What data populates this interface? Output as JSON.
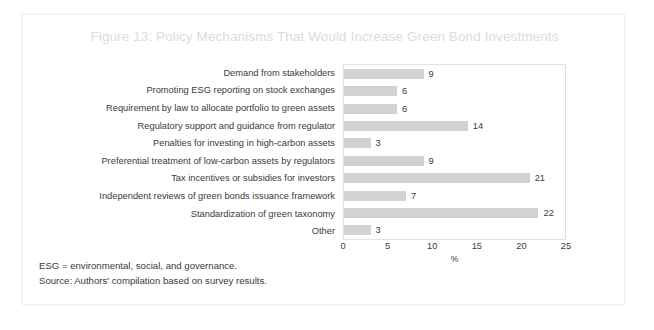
{
  "figure": {
    "title": "Figure 13: Policy Mechanisms That Would Increase Green Bond Investments",
    "notes": [
      "ESG = environmental, social, and governance.",
      "Source: Authors' compilation based on survey results."
    ]
  },
  "chart_data": {
    "type": "bar",
    "orientation": "horizontal",
    "title": "Figure 13: Policy Mechanisms That Would Increase Green Bond Investments",
    "categories": [
      "Demand from stakeholders",
      "Promoting ESG reporting on stock exchanges",
      "Requirement by law to allocate portfolio to green assets",
      "Regulatory support and guidance from regulator",
      "Penalties for investing in high-carbon assets",
      "Preferential treatment of low-carbon assets by regulators",
      "Tax incentives or subsidies for investors",
      "Independent reviews of green bonds issuance framework",
      "Standardization of green taxonomy",
      "Other"
    ],
    "values": [
      9,
      6,
      6,
      14,
      3,
      9,
      21,
      7,
      22,
      3
    ],
    "xlabel": "%",
    "ylabel": "",
    "xlim": [
      0,
      25
    ],
    "xticks": [
      0,
      5,
      10,
      15,
      20,
      25
    ],
    "grid": false,
    "legend": false,
    "bar_color": "#d2d2d2",
    "text_color": "#3a3a3a",
    "title_color": "#dcdcdc"
  }
}
